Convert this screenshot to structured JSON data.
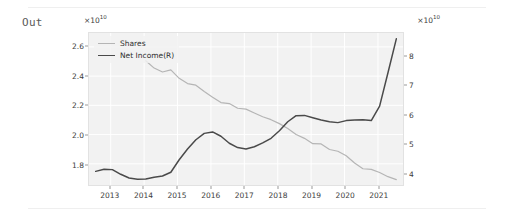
{
  "notebook": {
    "output_prompt": "Out"
  },
  "chart_data": {
    "type": "line",
    "title": "",
    "xlabel": "",
    "ylabel": "",
    "grid": true,
    "legend_position": "upper-left",
    "x_tick_labels": [
      "2013",
      "2014",
      "2015",
      "2016",
      "2017",
      "2018",
      "2019",
      "2020",
      "2021"
    ],
    "x_tick_values": [
      2013,
      2014,
      2015,
      2016,
      2017,
      2018,
      2019,
      2020,
      2021
    ],
    "xlim": [
      2012.35,
      2021.75
    ],
    "left_axis": {
      "exponent_label": "×10",
      "exponent_power": "10",
      "tick_labels": [
        "2.6",
        "2.4",
        "2.2",
        "2.0",
        "1.8"
      ],
      "tick_values": [
        2.6,
        2.4,
        2.2,
        2.0,
        1.8
      ],
      "ylim": [
        1.655,
        2.695
      ]
    },
    "right_axis": {
      "exponent_label": "×10",
      "exponent_power": "10",
      "tick_labels": [
        "8",
        "7",
        "6",
        "5",
        "4"
      ],
      "tick_values": [
        8,
        7,
        6,
        5,
        4
      ],
      "ylim": [
        3.58,
        8.82
      ]
    },
    "series": [
      {
        "name": "Shares",
        "axis": "left",
        "color": "#b5b5b5",
        "x": [
          2014.05,
          2014.3,
          2014.55,
          2014.8,
          2015.05,
          2015.3,
          2015.55,
          2015.8,
          2016.05,
          2016.3,
          2016.55,
          2016.8,
          2017.05,
          2017.3,
          2017.55,
          2017.8,
          2018.05,
          2018.3,
          2018.55,
          2018.8,
          2019.05,
          2019.3,
          2019.55,
          2019.8,
          2020.05,
          2020.3,
          2020.55,
          2020.8,
          2021.05,
          2021.3,
          2021.55
        ],
        "values": [
          2.505,
          2.455,
          2.428,
          2.443,
          2.385,
          2.349,
          2.338,
          2.295,
          2.256,
          2.219,
          2.212,
          2.18,
          2.174,
          2.148,
          2.122,
          2.102,
          2.075,
          2.041,
          2.001,
          1.974,
          1.938,
          1.936,
          1.898,
          1.886,
          1.855,
          1.806,
          1.766,
          1.762,
          1.741,
          1.712,
          1.692
        ]
      },
      {
        "name": "Net Income(R)",
        "axis": "right",
        "color": "#4a4a4a",
        "x": [
          2012.55,
          2012.8,
          2013.05,
          2013.3,
          2013.55,
          2013.8,
          2014.05,
          2014.3,
          2014.55,
          2014.8,
          2015.05,
          2015.3,
          2015.55,
          2015.8,
          2016.05,
          2016.3,
          2016.55,
          2016.8,
          2017.05,
          2017.3,
          2017.55,
          2017.8,
          2018.05,
          2018.3,
          2018.55,
          2018.8,
          2019.05,
          2019.3,
          2019.55,
          2019.8,
          2020.05,
          2020.3,
          2020.55,
          2020.8,
          2021.05,
          2021.3,
          2021.55
        ],
        "values": [
          4.05,
          4.12,
          4.11,
          3.95,
          3.82,
          3.78,
          3.79,
          3.85,
          3.89,
          4.02,
          4.45,
          4.82,
          5.14,
          5.36,
          5.41,
          5.26,
          5.02,
          4.87,
          4.82,
          4.9,
          5.03,
          5.19,
          5.45,
          5.76,
          5.97,
          5.98,
          5.9,
          5.82,
          5.76,
          5.73,
          5.8,
          5.82,
          5.83,
          5.8,
          6.3,
          7.45,
          8.62
        ]
      }
    ]
  }
}
